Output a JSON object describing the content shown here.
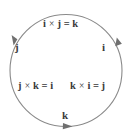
{
  "figure": {
    "circle_color": "#8a8a8a",
    "text_color": "#3b3b3b",
    "background": "#ffffff"
  },
  "nodes": [
    {
      "name": "j-left",
      "label": "j"
    },
    {
      "name": "i-right",
      "label": "i"
    },
    {
      "name": "k-bottom",
      "label": "k"
    }
  ],
  "equations": {
    "top": {
      "left": "i",
      "times": "×",
      "right": "j",
      "equals": "=",
      "result": "k"
    },
    "lower_left": {
      "left": "j",
      "times": "×",
      "right": "k",
      "equals": "=",
      "result": "i"
    },
    "lower_right": {
      "left": "k",
      "times": "×",
      "right": "i",
      "equals": "=",
      "result": "j"
    }
  },
  "arrows": [
    {
      "name": "arrow-left",
      "direction": "down"
    },
    {
      "name": "arrow-right",
      "direction": "down"
    },
    {
      "name": "arrow-bottom",
      "direction": "right"
    }
  ]
}
